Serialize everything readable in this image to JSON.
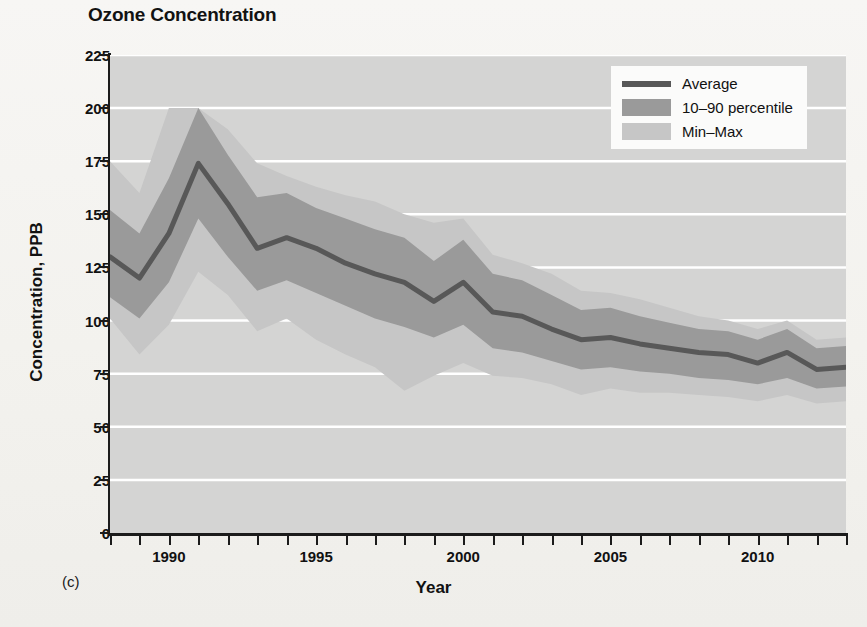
{
  "title": "Ozone Concentration",
  "panel_label": "(c)",
  "axes": {
    "y_title": "Concentration, PPB",
    "x_title": "Year",
    "y_ticks": [
      0,
      25,
      50,
      75,
      100,
      125,
      150,
      175,
      200,
      225
    ],
    "x_ticks_labeled": [
      1990,
      1995,
      2000,
      2005,
      2010
    ]
  },
  "legend": {
    "position": "top-right",
    "items": [
      {
        "label": "Average",
        "swatch": "line",
        "color": "#585858"
      },
      {
        "label": "10–90 percentile",
        "swatch": "band",
        "color": "#9a9a9a"
      },
      {
        "label": "Min–Max",
        "swatch": "band",
        "color": "#c6c6c6"
      }
    ]
  },
  "colors": {
    "plot_background": "#d4d4d3",
    "gridline": "#ffffff",
    "average_line": "#585858",
    "percentile_band": "#9a9a9a",
    "minmax_band": "#c6c6c6",
    "axis": "#1b1b1b",
    "page_background": "#f3f2ee"
  },
  "chart_data": {
    "type": "line",
    "title": "Ozone Concentration",
    "xlabel": "Year",
    "ylabel": "Concentration, PPB",
    "xlim": [
      1988,
      2013
    ],
    "ylim": [
      0,
      225
    ],
    "grid": true,
    "legend_position": "top-right",
    "x": [
      1988,
      1989,
      1990,
      1991,
      1992,
      1993,
      1994,
      1995,
      1996,
      1997,
      1998,
      1999,
      2000,
      2001,
      2002,
      2003,
      2004,
      2005,
      2006,
      2007,
      2008,
      2009,
      2010,
      2011,
      2012,
      2013
    ],
    "series": [
      {
        "name": "Average",
        "values": [
          130,
          120,
          141,
          174,
          155,
          134,
          139,
          134,
          127,
          122,
          118,
          109,
          118,
          104,
          102,
          96,
          91,
          92,
          89,
          87,
          85,
          84,
          80,
          85,
          77,
          78
        ]
      },
      {
        "name": "10 percentile",
        "values": [
          111,
          101,
          118,
          148,
          130,
          114,
          119,
          113,
          107,
          101,
          97,
          92,
          98,
          87,
          85,
          81,
          77,
          78,
          76,
          75,
          73,
          72,
          70,
          73,
          68,
          69
        ]
      },
      {
        "name": "90 percentile",
        "values": [
          152,
          141,
          167,
          200,
          178,
          158,
          160,
          153,
          148,
          143,
          139,
          128,
          138,
          122,
          119,
          112,
          105,
          106,
          102,
          99,
          96,
          95,
          91,
          96,
          87,
          88
        ]
      },
      {
        "name": "Min",
        "values": [
          101,
          84,
          98,
          123,
          112,
          95,
          101,
          91,
          84,
          78,
          67,
          74,
          80,
          74,
          73,
          70,
          65,
          68,
          66,
          66,
          65,
          64,
          62,
          65,
          61,
          62
        ]
      },
      {
        "name": "Max",
        "values": [
          175,
          160,
          200,
          200,
          190,
          174,
          168,
          163,
          159,
          156,
          150,
          146,
          148,
          131,
          127,
          122,
          114,
          113,
          110,
          106,
          102,
          100,
          96,
          100,
          91,
          92
        ]
      }
    ]
  }
}
